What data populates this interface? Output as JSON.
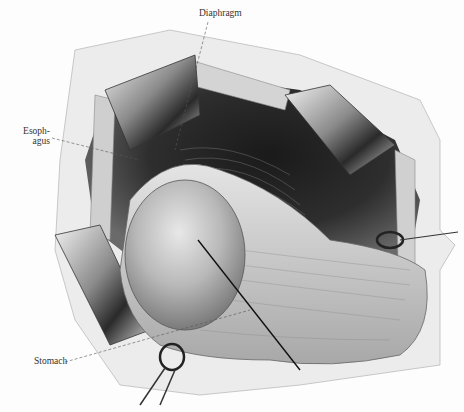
{
  "figure": {
    "type": "anatomical surgical illustration",
    "labels": {
      "diaphragm": "Diaphragm",
      "esophagus_line1": "Esoph-",
      "esophagus_line2": "agus",
      "stomach": "Stomach"
    }
  }
}
